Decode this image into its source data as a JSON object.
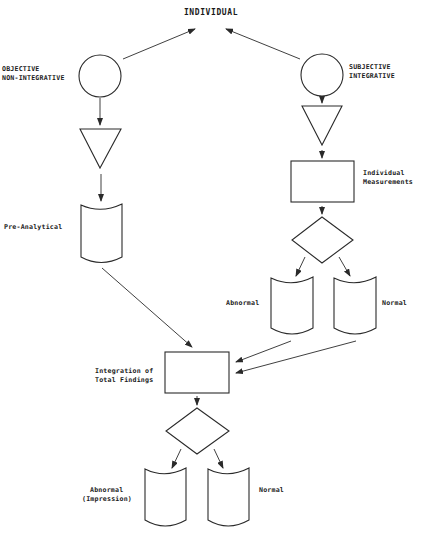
{
  "diagram": {
    "title": "INDIVIDUAL",
    "left_branch": {
      "label_line1": "OBJECTIVE",
      "label_line2": "NON-INTEGRATIVE",
      "doc_label": "Pre-Analytical"
    },
    "right_branch": {
      "label_line1": "SUBJECTIVE",
      "label_line2": "INTEGRATIVE",
      "process_label_line1": "Individual",
      "process_label_line2": "Measurements",
      "doc_abnormal_label": "Abnormal",
      "doc_normal_label": "Normal"
    },
    "integration": {
      "label_line1": "Integration of",
      "label_line2": "Total Findings",
      "doc_abnormal_line1": "Abnormal",
      "doc_abnormal_line2": "(Impression)",
      "doc_normal_label": "Normal"
    },
    "colors": {
      "stroke": "#2a2a2a",
      "background": "#ffffff",
      "text": "#1a1a1a"
    }
  }
}
